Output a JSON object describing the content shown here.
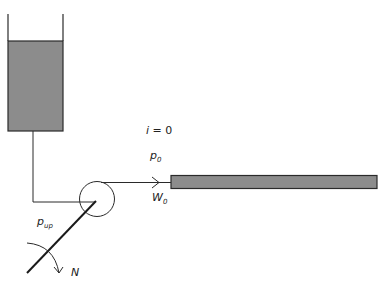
{
  "diagram": {
    "labels": {
      "index": {
        "var": "i",
        "op": " = ",
        "value": "0"
      },
      "pressure_out": {
        "base": "p",
        "sub": "0"
      },
      "flow_out": {
        "base": "W",
        "sub": "0"
      },
      "pressure_up": {
        "base": "p",
        "sub": "up"
      },
      "speed": {
        "base": "N"
      }
    },
    "components": [
      "reservoir-tank",
      "suction-pipe",
      "pump",
      "discharge-pipe",
      "flow-arrow",
      "channel",
      "shaft",
      "rotation-arrow"
    ],
    "colors": {
      "fill": "#8c8c8c",
      "stroke": "#2a2a2a",
      "background": "#ffffff"
    }
  }
}
